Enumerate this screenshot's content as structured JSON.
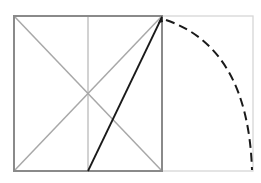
{
  "diagram": {
    "title": "",
    "colors": {
      "square": "#8a8a8a",
      "diagonals": "#a8a8a8",
      "midline": "#b4b4b4",
      "extension_rect": "#d6d6d6",
      "construction_line": "#1a1a1a",
      "arc": "#1a1a1a",
      "background": "#ffffff"
    },
    "geometry": {
      "square": {
        "x1": 14,
        "y1": 16,
        "x2": 162,
        "y2": 171
      },
      "extension_right": 253,
      "midpoint_x": 88,
      "arc_end": {
        "x": 252,
        "y": 170
      }
    }
  }
}
